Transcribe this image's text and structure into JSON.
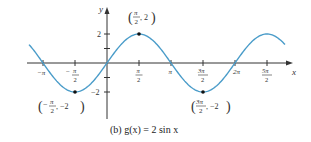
{
  "chart_data": {
    "type": "line",
    "title": "",
    "caption": "(b)  g(x)  =  2 sin x",
    "function": "g(x) = 2 sin x",
    "xlabel": "x",
    "ylabel": "y",
    "xlim_radians": [
      -3.6,
      4.6
    ],
    "ylim": [
      -3.8,
      3.8
    ],
    "grid": false,
    "legend": null,
    "x_ticks": [
      {
        "value": "-π",
        "num": "−π",
        "den": ""
      },
      {
        "value": "-π/2",
        "num": "−π",
        "den": "2"
      },
      {
        "value": "π/2",
        "num": "π",
        "den": "2"
      },
      {
        "value": "π",
        "num": "π",
        "den": ""
      },
      {
        "value": "3π/2",
        "num": "3π",
        "den": "2"
      },
      {
        "value": "2π",
        "num": "2π",
        "den": ""
      },
      {
        "value": "5π/2",
        "num": "5π",
        "den": "2"
      }
    ],
    "y_ticks": [
      "2",
      "−2"
    ],
    "series": [
      {
        "name": "g(x) = 2 sin x",
        "color": "#4a9cc9",
        "x": [
          "-π",
          "-π/2",
          "0",
          "π/2",
          "π",
          "3π/2",
          "2π",
          "5π/2"
        ],
        "values": [
          0,
          -2,
          0,
          2,
          0,
          -2,
          0,
          2
        ]
      }
    ],
    "annotations": [
      {
        "point": [
          "π/2",
          2
        ],
        "label": "(π/2, 2)"
      },
      {
        "point": [
          "-π/2",
          -2
        ],
        "label": "(−π/2, −2)"
      },
      {
        "point": [
          "3π/2",
          -2
        ],
        "label": "(3π/2, −2)"
      }
    ]
  },
  "labels": {
    "x_axis": "x",
    "y_axis": "y",
    "ytick_pos": "2",
    "ytick_neg": "−2",
    "xt_neg_pi": "−π",
    "xt_neg_half_pi_num": "−",
    "xt_neg_half_pi_pi": "π",
    "xt_neg_half_pi_den": "2",
    "xt_half_pi_num": "π",
    "xt_half_pi_den": "2",
    "xt_pi": "π",
    "xt_3half_pi_num": "3π",
    "xt_3half_pi_den": "2",
    "xt_2pi": "2π",
    "xt_5half_pi_num": "5π",
    "xt_5half_pi_den": "2",
    "ann_max_num": "π",
    "ann_max_den": "2",
    "ann_max_y": ", 2",
    "ann_min1_num": "π",
    "ann_min1_den": "2",
    "ann_min1_neg": "−",
    "ann_min1_y": ", −2",
    "ann_min2_num": "3π",
    "ann_min2_den": "2",
    "ann_min2_y": ", −2",
    "caption": "(b)  g(x)  =  2 sin x"
  },
  "colors": {
    "curve": "#4a9cc9",
    "axis": "#333333",
    "point": "#111111"
  }
}
